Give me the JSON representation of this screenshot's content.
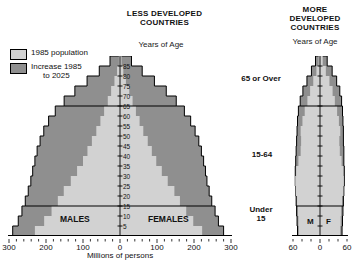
{
  "left_chart": {
    "title": "LESS DEVELOPED\nCOUNTRIES",
    "title_line1": "LESS DEVELOPED",
    "title_line2": "COUNTRIES",
    "axis_title": "Years of Age",
    "units_label": "Millions of persons",
    "male_label": "MALES",
    "female_label": "FEMALES",
    "x_ticks": [
      "300",
      "200",
      "100",
      "0",
      "100",
      "200",
      "300"
    ]
  },
  "right_chart": {
    "title_line1": "MORE",
    "title_line2": "DEVELOPED",
    "title_line3": "COUNTRIES",
    "axis_title": "Years of Age",
    "male_label": "M",
    "female_label": "F",
    "x_ticks": [
      "60",
      "0",
      "60"
    ]
  },
  "legend": {
    "items": [
      {
        "swatch": "light",
        "line1": "1985 population",
        "line2": ""
      },
      {
        "swatch": "dark",
        "line1": "Increase 1985",
        "line2": "to 2025"
      }
    ]
  },
  "age_group_labels": {
    "over65": "65 or Over",
    "working": "15-64",
    "under15_line1": "Under",
    "under15_line2": "15"
  },
  "colors": {
    "population_1985": "#d2d2d2",
    "increase_1985_2025": "#8f8f8f",
    "outline": "#000000",
    "background": "#ffffff"
  },
  "chart_data": {
    "type": "bar",
    "subtitle": "Population pyramids, 1985 population and projected increase 1985 to 2025",
    "xlabel": "Millions of persons",
    "ylabel": "Years of Age",
    "grid": false,
    "legend_position": "top-left",
    "age_ticks": [
      5,
      10,
      15,
      20,
      25,
      30,
      35,
      40,
      45,
      50,
      55,
      60,
      65,
      70,
      75,
      80,
      85
    ],
    "panels": [
      {
        "name": "LESS DEVELOPED COUNTRIES",
        "xlim": [
          -300,
          300
        ],
        "x_ticks": [
          -300,
          -200,
          -100,
          0,
          100,
          200,
          300
        ],
        "age_bands": [
          "0-4",
          "5-9",
          "10-14",
          "15-19",
          "20-24",
          "25-29",
          "30-34",
          "35-39",
          "40-44",
          "45-49",
          "50-54",
          "55-59",
          "60-64",
          "65-69",
          "70-74",
          "75-79",
          "80-84",
          "85+"
        ],
        "series": [
          {
            "name": "1985 population",
            "color": "#d2d2d2",
            "males": [
              230,
              205,
              185,
              168,
              152,
              133,
              116,
              100,
              88,
              76,
              64,
              53,
              43,
              33,
              24,
              15,
              8,
              3
            ],
            "females": [
              222,
              198,
              179,
              162,
              147,
              129,
              113,
              98,
              86,
              75,
              63,
              53,
              43,
              34,
              25,
              16,
              9,
              4
            ]
          },
          {
            "name": "Increase 1985 to 2025",
            "color": "#8f8f8f",
            "males": [
              60,
              70,
              80,
              88,
              96,
              108,
              120,
              130,
              136,
              140,
              142,
              140,
              132,
              118,
              98,
              74,
              48,
              24
            ],
            "females": [
              58,
              68,
              78,
              86,
              94,
              106,
              118,
              128,
              134,
              138,
              140,
              138,
              131,
              118,
              100,
              77,
              51,
              27
            ]
          }
        ],
        "totals": {
          "males": [
            290,
            275,
            265,
            256,
            248,
            241,
            236,
            230,
            224,
            216,
            206,
            193,
            175,
            151,
            122,
            89,
            56,
            27
          ],
          "females": [
            280,
            266,
            257,
            248,
            241,
            235,
            231,
            226,
            220,
            213,
            203,
            191,
            174,
            152,
            125,
            93,
            60,
            31
          ]
        }
      },
      {
        "name": "MORE DEVELOPED COUNTRIES",
        "xlim": [
          -60,
          60
        ],
        "x_ticks": [
          -60,
          0,
          60
        ],
        "age_bands": [
          "0-4",
          "5-9",
          "10-14",
          "15-19",
          "20-24",
          "25-29",
          "30-34",
          "35-39",
          "40-44",
          "45-49",
          "50-54",
          "55-59",
          "60-64",
          "65-69",
          "70-74",
          "75-79",
          "80-84",
          "85+"
        ],
        "series": [
          {
            "name": "1985 population",
            "color": "#d2d2d2",
            "males": [
              47,
              48,
              49,
              51,
              54,
              55,
              53,
              48,
              43,
              42,
              43,
              39,
              34,
              28,
              22,
              15,
              8,
              3
            ],
            "females": [
              45,
              46,
              47,
              49,
              52,
              53,
              52,
              48,
              44,
              43,
              45,
              42,
              38,
              33,
              28,
              21,
              13,
              6
            ]
          },
          {
            "name": "Increase 1985 to 2025",
            "color": "#8f8f8f",
            "males": [
              3,
              3,
              3,
              2,
              0,
              0,
              2,
              6,
              10,
              10,
              8,
              11,
              14,
              16,
              16,
              14,
              11,
              7
            ],
            "females": [
              4,
              4,
              4,
              3,
              1,
              1,
              2,
              5,
              9,
              9,
              7,
              9,
              12,
              15,
              16,
              16,
              14,
              10
            ]
          }
        ],
        "totals": {
          "males": [
            50,
            51,
            52,
            53,
            54,
            55,
            55,
            54,
            53,
            52,
            51,
            50,
            48,
            44,
            38,
            29,
            19,
            10
          ],
          "females": [
            49,
            50,
            51,
            52,
            53,
            54,
            54,
            53,
            53,
            52,
            52,
            51,
            50,
            48,
            44,
            37,
            27,
            16
          ]
        }
      }
    ]
  }
}
